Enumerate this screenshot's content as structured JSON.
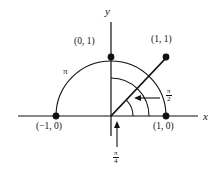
{
  "figure": {
    "type": "unit-circle-angle-diagram",
    "axes": {
      "x_label": "x",
      "y_label": "y",
      "x_range": [
        -1.72,
        1.62
      ],
      "y_range": [
        -0.52,
        1.62
      ],
      "origin_px": [
        111,
        116
      ],
      "unit_px": 55
    },
    "points": [
      {
        "name": "point-0-1",
        "label": "(0, 1)",
        "x": 0,
        "y": 1
      },
      {
        "name": "point-1-1",
        "label": "(1, 1)",
        "x": 1,
        "y": 1
      },
      {
        "name": "point-neg1-0",
        "label": "(−1, 0)",
        "x": -1,
        "y": 0
      },
      {
        "name": "point-1-0",
        "label": "(1, 0)",
        "x": 1,
        "y": 0
      }
    ],
    "ray": {
      "name": "ray-45-degrees",
      "from": [
        0,
        0
      ],
      "to": [
        1,
        1
      ],
      "angle_deg": 45
    },
    "arcs": [
      {
        "name": "arc-pi",
        "radius_px": 55,
        "start_deg": 0,
        "end_deg": 180,
        "label": "π"
      },
      {
        "name": "arc-pi-over-2",
        "radius_px": 38,
        "start_deg": 0,
        "end_deg": 90,
        "label_num": "π",
        "label_den": "2"
      },
      {
        "name": "arc-pi-over-4",
        "radius_px": 22,
        "start_deg": 0,
        "end_deg": 45,
        "label_num": "π",
        "label_den": "4"
      }
    ],
    "annotations": [
      {
        "name": "arrow-pi-over-2",
        "direction": "left",
        "num": "π",
        "den": "2"
      },
      {
        "name": "arrow-pi-over-4",
        "direction": "up",
        "num": "π",
        "den": "4"
      }
    ],
    "colors": {
      "stroke": "#111111",
      "background": "#ffffff"
    }
  }
}
